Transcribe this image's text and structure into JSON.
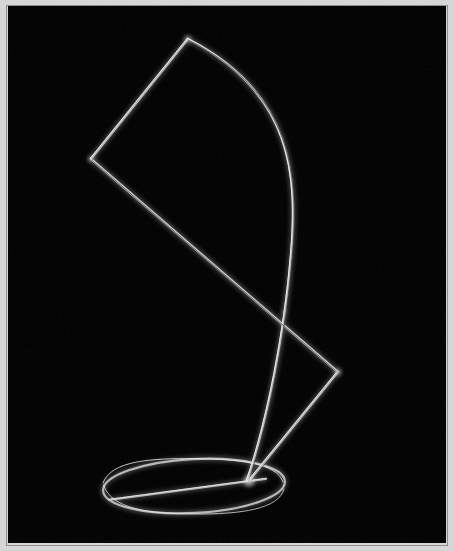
{
  "image": {
    "kind": "photograph",
    "subject": "wire-sculpture",
    "title": "Abstract bent-wire sculpture on elliptical base",
    "width": 454,
    "height": 551,
    "orientation": "portrait"
  },
  "palette": {
    "background": "#000000",
    "frame_border": "#d6d6d6",
    "frame_border_inner": "#8e8e8e",
    "wire_core": "#f2f2f2",
    "wire_mid": "#b9b9b9",
    "wire_dim": "#6e6e6e",
    "wire_faint": "#3a3a3a",
    "page_surround": "#6b6b6b"
  },
  "frame": {
    "border_width_px": 4,
    "inset_left": 8,
    "inset_top": 6,
    "inset_right": 8,
    "inset_bottom": 8
  },
  "lighting": {
    "source": "upper-left",
    "description": "Thin metal rod reflects a narrow specular highlight; background is unlit black."
  },
  "sculpture": {
    "description": "A single thin metal rod bent into a quadrilateral loop, a long bowed arc, and a circular foot ring that reads as an ellipse in perspective.",
    "parts": [
      {
        "id": "quadrilateral",
        "name": "quadrilateral-loop",
        "label": "Tilted quadrilateral wire loop",
        "closed": false,
        "vertices": [
          {
            "name": "apex-top",
            "x": 188,
            "y": 39
          },
          {
            "name": "vertex-left",
            "x": 91,
            "y": 159
          },
          {
            "name": "vertex-right-lower",
            "x": 338,
            "y": 372
          },
          {
            "name": "base-convergence",
            "x": 249,
            "y": 481
          }
        ],
        "edges": [
          {
            "from": "apex-top",
            "to": "vertex-left"
          },
          {
            "from": "vertex-left",
            "to": "vertex-right-lower"
          },
          {
            "from": "vertex-right-lower",
            "to": "base-convergence"
          }
        ]
      },
      {
        "id": "arc",
        "name": "bowed-arc",
        "label": "Long bowed arc from apex to base",
        "start": {
          "x": 188,
          "y": 39
        },
        "end": {
          "x": 247,
          "y": 481
        },
        "bow_apex": {
          "x": 291,
          "y": 246
        },
        "bow_direction": "right"
      },
      {
        "id": "foot-ring",
        "name": "elliptical-foot-ring",
        "label": "Circular base ring seen in perspective",
        "center": {
          "x": 194,
          "y": 486
        },
        "radius_x": 91,
        "radius_y": 27,
        "rotation_deg": -3
      },
      {
        "id": "foot-chord",
        "name": "base-chord-strut",
        "label": "Straight strut crossing the foot ring",
        "from": {
          "x": 109,
          "y": 500
        },
        "to": {
          "x": 266,
          "y": 479
        }
      }
    ],
    "crossings": [
      {
        "name": "arc-over-diagonal",
        "x": 284,
        "y": 312
      },
      {
        "name": "arc-meets-base",
        "x": 248,
        "y": 480
      }
    ]
  }
}
